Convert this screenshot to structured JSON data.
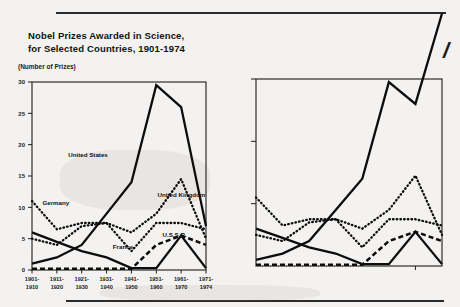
{
  "figure": {
    "y_axis_note": "(Number of Prizes)",
    "page_mark": "/"
  },
  "chart_data": {
    "type": "line",
    "xlabel": "",
    "ylabel": "(Number of Prizes)",
    "ylim": [
      0,
      30
    ],
    "yticks": [
      0,
      5,
      10,
      15,
      20,
      25,
      30
    ],
    "ytick_labels": [
      "0",
      "5",
      "10",
      "15",
      "20",
      "25",
      "30"
    ],
    "grid": false,
    "legend": "inline-annotations",
    "categories": [
      "1901-\n1910",
      "1911-\n1920",
      "1921-\n1930",
      "1931-\n1940",
      "1941-\n1950",
      "1951-\n1960",
      "1961-\n1970",
      "1971-\n1974"
    ],
    "category_labels_top": [
      "1901-",
      "1911-",
      "1921-",
      "1931-",
      "1941-",
      "1951-",
      "1961-",
      "1971-"
    ],
    "category_labels_bottom": [
      "1910",
      "1920",
      "1930",
      "1940",
      "1950",
      "1960",
      "1970",
      "1974"
    ],
    "series": [
      {
        "name": "United States",
        "style": "solid",
        "label": "United States",
        "values": [
          1,
          2,
          4,
          9,
          14,
          29.5,
          26,
          7
        ]
      },
      {
        "name": "United Kingdom",
        "style": "dotted",
        "label": "United Kingdom",
        "values": [
          5,
          4,
          7,
          7.5,
          6,
          9,
          14.5,
          5
        ]
      },
      {
        "name": "Germany",
        "style": "dotted",
        "label": "Germany",
        "values": [
          11,
          6.5,
          7.5,
          7.5,
          3,
          7.5,
          7.5,
          6.5
        ]
      },
      {
        "name": "France",
        "style": "solid",
        "label": "France",
        "values": [
          6,
          4.5,
          3,
          2,
          0.3,
          0.3,
          5.5,
          0.3
        ]
      },
      {
        "name": "U.S.S.R.",
        "style": "dashed",
        "label": "U.S.S.R.",
        "values": [
          0.2,
          0.2,
          0.2,
          0.2,
          0.2,
          4,
          5.5,
          4
        ]
      }
    ],
    "panels": [
      {
        "name": "main-panel",
        "labeled": true
      },
      {
        "name": "duplicate-panel",
        "labeled": false,
        "note": "cropped repeat of same plot, top series overshoots frame"
      }
    ]
  }
}
